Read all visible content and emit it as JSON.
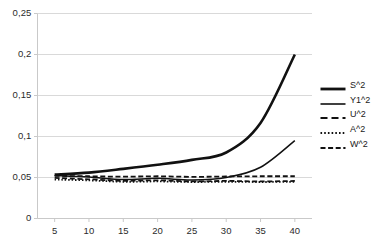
{
  "chart_data": {
    "type": "line",
    "title": "",
    "xlabel": "",
    "ylabel": "",
    "xlim": [
      2.5,
      42.5
    ],
    "ylim": [
      0,
      0.25
    ],
    "grid": true,
    "grid_axis": "y",
    "legend_position": "right",
    "x_ticks": [
      5,
      10,
      15,
      20,
      25,
      30,
      35,
      40
    ],
    "x_tick_labels": [
      "5",
      "10",
      "15",
      "20",
      "25",
      "30",
      "35",
      "40"
    ],
    "y_ticks": [
      0,
      0.05,
      0.1,
      0.15,
      0.2,
      0.25
    ],
    "y_tick_labels": [
      "0",
      "0,05",
      "0,1",
      "0,15",
      "0,2",
      "0,25"
    ],
    "x": [
      5,
      10,
      15,
      20,
      25,
      30,
      35,
      40
    ],
    "series": [
      {
        "name": "S^2",
        "style": "solid",
        "width": 2.6,
        "color": "#111111",
        "values": [
          0.0535,
          0.056,
          0.0605,
          0.0655,
          0.0715,
          0.0805,
          0.1165,
          0.2
        ]
      },
      {
        "name": "Y1^2",
        "style": "solid",
        "width": 1.5,
        "color": "#111111",
        "values": [
          0.0525,
          0.0505,
          0.0475,
          0.049,
          0.047,
          0.05,
          0.0625,
          0.095
        ]
      },
      {
        "name": "U^2",
        "style": "dashed",
        "width": 1.8,
        "color": "#111111",
        "values": [
          0.052,
          0.0515,
          0.051,
          0.0515,
          0.0508,
          0.0512,
          0.0515,
          0.0515
        ]
      },
      {
        "name": "A^2",
        "style": "dotted",
        "width": 1.8,
        "color": "#111111",
        "values": [
          0.0475,
          0.0465,
          0.0448,
          0.0452,
          0.0445,
          0.0448,
          0.0445,
          0.0448
        ]
      },
      {
        "name": "W^2",
        "style": "dashed",
        "width": 1.8,
        "color": "#111111",
        "values": [
          0.0495,
          0.0478,
          0.046,
          0.0466,
          0.0452,
          0.0458,
          0.0452,
          0.0458
        ]
      }
    ]
  },
  "axes": {
    "y_labels": [
      "0,25",
      "0,2",
      "0,15",
      "0,1",
      "0,05",
      "0"
    ],
    "x_labels": [
      "5",
      "10",
      "15",
      "20",
      "25",
      "30",
      "35",
      "40"
    ]
  },
  "legend": {
    "items": [
      {
        "label": "S^2",
        "style": "solid-thick"
      },
      {
        "label": "Y1^2",
        "style": "solid-thin"
      },
      {
        "label": "U^2",
        "style": "dash-long"
      },
      {
        "label": "A^2",
        "style": "dotted"
      },
      {
        "label": "W^2",
        "style": "dash-medium"
      }
    ]
  },
  "colors": {
    "line": "#111111",
    "grid": "#d9d9d9",
    "axis": "#c9c9c9",
    "text": "#2b2b2b",
    "background": "#ffffff"
  }
}
